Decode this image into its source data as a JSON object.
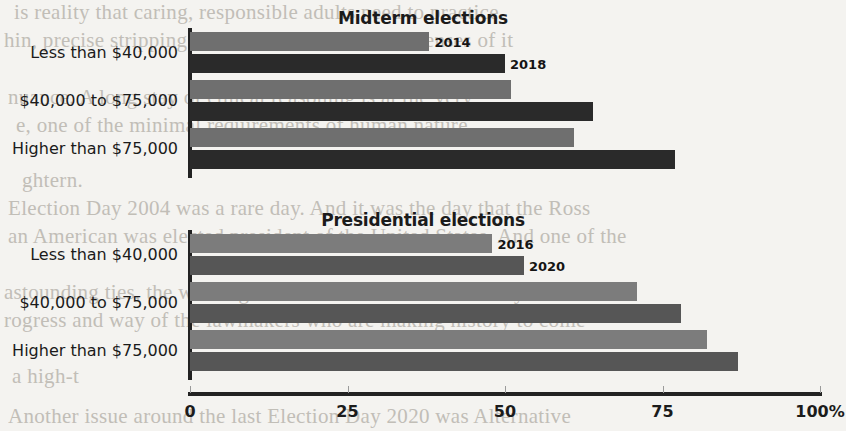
{
  "background_texts": [
    {
      "text": "is reality that caring, responsible adults need to practice",
      "x": 14,
      "y": 0,
      "size": 21
    },
    {
      "text": "hin, precise stripping are not a cent of meant defenses of it",
      "x": 4,
      "y": 28,
      "size": 21
    },
    {
      "text": "nuance. A long stay of ethical reasoning is at the very",
      "x": 8,
      "y": 85,
      "size": 21
    },
    {
      "text": "e, one of the minimal requirements of human nature",
      "x": 16,
      "y": 113,
      "size": 21
    },
    {
      "text": "ghtern.",
      "x": 22,
      "y": 168,
      "size": 21
    },
    {
      "text": "Election Day 2004 was a rare day. And it was the day that the Ross",
      "x": 8,
      "y": 196,
      "size": 21
    },
    {
      "text": "an American was elected president of the United States. And one of the",
      "x": 8,
      "y": 224,
      "size": 21
    },
    {
      "text": "astounding ties, the winning side lost. A Democratic victory was seen",
      "x": 4,
      "y": 280,
      "size": 21
    },
    {
      "text": "rogress and way of the lawmakers who are making history to come",
      "x": 4,
      "y": 308,
      "size": 21
    },
    {
      "text": "a high-t",
      "x": 12,
      "y": 364,
      "size": 21
    },
    {
      "text": "Another issue around the last Election Day 2020 was Alternative",
      "x": 8,
      "y": 404,
      "size": 21
    }
  ],
  "chart_data": [
    {
      "type": "bar",
      "orientation": "horizontal",
      "title": "Midterm elections",
      "categories": [
        "Less than $40,000",
        "$40,000 to $75,000",
        "Higher than $75,000"
      ],
      "series": [
        {
          "name": "2014",
          "color": "#6f6f6f",
          "values": [
            38,
            51,
            61
          ]
        },
        {
          "name": "2018",
          "color": "#2a2a2a",
          "values": [
            50,
            64,
            77
          ]
        }
      ],
      "xlabel": "",
      "ylabel": "",
      "xlim": [
        0,
        100
      ],
      "xticks": [
        0,
        25,
        50,
        75,
        100
      ],
      "xtick_labels": [
        "0",
        "25",
        "50",
        "75",
        "100%"
      ],
      "grid": false,
      "legend": "inline-end-of-bar"
    },
    {
      "type": "bar",
      "orientation": "horizontal",
      "title": "Presidential elections",
      "categories": [
        "Less than $40,000",
        "$40,000 to $75,000",
        "Higher than $75,000"
      ],
      "series": [
        {
          "name": "2016",
          "color": "#7c7c7c",
          "values": [
            48,
            71,
            82
          ]
        },
        {
          "name": "2020",
          "color": "#565656",
          "values": [
            53,
            78,
            87
          ]
        }
      ],
      "xlabel": "",
      "ylabel": "",
      "xlim": [
        0,
        100
      ],
      "xticks": [
        0,
        25,
        50,
        75,
        100
      ],
      "xtick_labels": [
        "0",
        "25",
        "50",
        "75",
        "100%"
      ],
      "grid": false,
      "legend": "inline-end-of-bar"
    }
  ],
  "axis": {
    "x0_px": 190,
    "x100_px": 820,
    "tick_labels": [
      "0",
      "25",
      "50",
      "75",
      "100%"
    ],
    "tick_values": [
      0,
      25,
      50,
      75,
      100
    ]
  },
  "panels": [
    {
      "id": "midterm",
      "title": "Midterm elections",
      "title_y": 8,
      "plot_top": 44,
      "series_labels": [
        {
          "text": "2014",
          "value_index": 0,
          "row": 0
        },
        {
          "text": "2018",
          "value_index": 1,
          "row": 0
        }
      ]
    },
    {
      "id": "presidential",
      "title": "Presidential elections",
      "title_y": 210,
      "plot_top": 248,
      "series_labels": [
        {
          "text": "2016",
          "value_index": 0,
          "row": 0
        },
        {
          "text": "2020",
          "value_index": 1,
          "row": 0
        }
      ]
    }
  ]
}
